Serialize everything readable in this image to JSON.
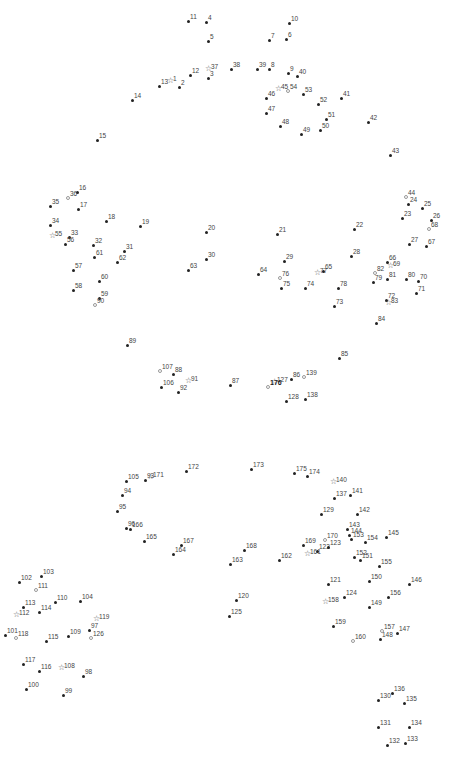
{
  "puzzle": {
    "type": "connect-the-dots",
    "dot_color": "#222222",
    "label_color": "#444444",
    "points": [
      {
        "n": "1",
        "x": 171,
        "y": 83,
        "m": "star"
      },
      {
        "n": "2",
        "x": 179,
        "y": 87,
        "m": "dot"
      },
      {
        "n": "3",
        "x": 208,
        "y": 78,
        "m": "dot"
      },
      {
        "n": "4",
        "x": 206,
        "y": 22,
        "m": "dot"
      },
      {
        "n": "5",
        "x": 208,
        "y": 41,
        "m": "dot"
      },
      {
        "n": "6",
        "x": 286,
        "y": 39,
        "m": "dot"
      },
      {
        "n": "7",
        "x": 269,
        "y": 40,
        "m": "dot"
      },
      {
        "n": "8",
        "x": 269,
        "y": 69,
        "m": "dot"
      },
      {
        "n": "9",
        "x": 288,
        "y": 73,
        "m": "dot"
      },
      {
        "n": "10",
        "x": 289,
        "y": 23,
        "m": "dot"
      },
      {
        "n": "11",
        "x": 188,
        "y": 21,
        "m": "dot"
      },
      {
        "n": "12",
        "x": 190,
        "y": 75,
        "m": "dot"
      },
      {
        "n": "13",
        "x": 159,
        "y": 86,
        "m": "dot"
      },
      {
        "n": "14",
        "x": 132,
        "y": 100,
        "m": "dot"
      },
      {
        "n": "15",
        "x": 97,
        "y": 140,
        "m": "dot"
      },
      {
        "n": "16",
        "x": 77,
        "y": 192,
        "m": "dot"
      },
      {
        "n": "17",
        "x": 78,
        "y": 209,
        "m": "dot"
      },
      {
        "n": "18",
        "x": 106,
        "y": 221,
        "m": "dot"
      },
      {
        "n": "19",
        "x": 140,
        "y": 226,
        "m": "dot"
      },
      {
        "n": "20",
        "x": 206,
        "y": 232,
        "m": "dot"
      },
      {
        "n": "21",
        "x": 277,
        "y": 234,
        "m": "dot"
      },
      {
        "n": "22",
        "x": 354,
        "y": 229,
        "m": "dot"
      },
      {
        "n": "23",
        "x": 402,
        "y": 218,
        "m": "dot"
      },
      {
        "n": "24",
        "x": 408,
        "y": 204,
        "m": "dot"
      },
      {
        "n": "25",
        "x": 422,
        "y": 208,
        "m": "dot"
      },
      {
        "n": "26",
        "x": 431,
        "y": 220,
        "m": "dot"
      },
      {
        "n": "27",
        "x": 409,
        "y": 244,
        "m": "dot"
      },
      {
        "n": "28",
        "x": 351,
        "y": 256,
        "m": "dot"
      },
      {
        "n": "29",
        "x": 284,
        "y": 261,
        "m": "dot"
      },
      {
        "n": "30",
        "x": 206,
        "y": 259,
        "m": "dot"
      },
      {
        "n": "31",
        "x": 124,
        "y": 251,
        "m": "dot"
      },
      {
        "n": "32",
        "x": 93,
        "y": 245,
        "m": "dot"
      },
      {
        "n": "33",
        "x": 69,
        "y": 237,
        "m": "dot"
      },
      {
        "n": "34",
        "x": 50,
        "y": 225,
        "m": "dot"
      },
      {
        "n": "35",
        "x": 50,
        "y": 206,
        "m": "dot"
      },
      {
        "n": "36",
        "x": 68,
        "y": 198,
        "m": "hollow"
      },
      {
        "n": "37",
        "x": 209,
        "y": 71,
        "m": "star"
      },
      {
        "n": "38",
        "x": 231,
        "y": 69,
        "m": "dot"
      },
      {
        "n": "39",
        "x": 257,
        "y": 69,
        "m": "dot"
      },
      {
        "n": "40",
        "x": 297,
        "y": 76,
        "m": "dot"
      },
      {
        "n": "41",
        "x": 341,
        "y": 98,
        "m": "dot"
      },
      {
        "n": "42",
        "x": 368,
        "y": 122,
        "m": "dot"
      },
      {
        "n": "43",
        "x": 390,
        "y": 155,
        "m": "dot"
      },
      {
        "n": "44",
        "x": 406,
        "y": 197,
        "m": "hollow"
      },
      {
        "n": "45",
        "x": 279,
        "y": 91,
        "m": "star"
      },
      {
        "n": "46",
        "x": 266,
        "y": 98,
        "m": "dot"
      },
      {
        "n": "47",
        "x": 266,
        "y": 113,
        "m": "dot"
      },
      {
        "n": "48",
        "x": 280,
        "y": 126,
        "m": "dot"
      },
      {
        "n": "49",
        "x": 301,
        "y": 134,
        "m": "dot"
      },
      {
        "n": "50",
        "x": 320,
        "y": 130,
        "m": "dot"
      },
      {
        "n": "51",
        "x": 326,
        "y": 119,
        "m": "dot"
      },
      {
        "n": "52",
        "x": 318,
        "y": 104,
        "m": "dot"
      },
      {
        "n": "53",
        "x": 303,
        "y": 94,
        "m": "dot"
      },
      {
        "n": "54",
        "x": 288,
        "y": 91,
        "m": "hollow"
      },
      {
        "n": "55",
        "x": 53,
        "y": 238,
        "m": "star"
      },
      {
        "n": "56",
        "x": 65,
        "y": 244,
        "m": "dot"
      },
      {
        "n": "57",
        "x": 73,
        "y": 270,
        "m": "dot"
      },
      {
        "n": "58",
        "x": 73,
        "y": 290,
        "m": "dot"
      },
      {
        "n": "59",
        "x": 99,
        "y": 298,
        "m": "dot"
      },
      {
        "n": "60",
        "x": 99,
        "y": 281,
        "m": "dot"
      },
      {
        "n": "61",
        "x": 94,
        "y": 257,
        "m": "dot"
      },
      {
        "n": "62",
        "x": 117,
        "y": 262,
        "m": "dot"
      },
      {
        "n": "63",
        "x": 188,
        "y": 270,
        "m": "dot"
      },
      {
        "n": "64",
        "x": 258,
        "y": 274,
        "m": "dot"
      },
      {
        "n": "65",
        "x": 323,
        "y": 271,
        "m": "dot"
      },
      {
        "n": "66",
        "x": 387,
        "y": 262,
        "m": "dot"
      },
      {
        "n": "67",
        "x": 426,
        "y": 246,
        "m": "dot"
      },
      {
        "n": "68",
        "x": 429,
        "y": 229,
        "m": "hollow"
      },
      {
        "n": "69",
        "x": 391,
        "y": 268,
        "m": "star"
      },
      {
        "n": "70",
        "x": 418,
        "y": 281,
        "m": "dot"
      },
      {
        "n": "71",
        "x": 416,
        "y": 293,
        "m": "dot"
      },
      {
        "n": "72",
        "x": 386,
        "y": 300,
        "m": "dot"
      },
      {
        "n": "73",
        "x": 334,
        "y": 306,
        "m": "dot"
      },
      {
        "n": "74",
        "x": 305,
        "y": 288,
        "m": "dot"
      },
      {
        "n": "75",
        "x": 281,
        "y": 288,
        "m": "dot"
      },
      {
        "n": "76",
        "x": 280,
        "y": 278,
        "m": "hollow"
      },
      {
        "n": "77",
        "x": 318,
        "y": 275,
        "m": "star"
      },
      {
        "n": "78",
        "x": 338,
        "y": 288,
        "m": "dot"
      },
      {
        "n": "79",
        "x": 373,
        "y": 282,
        "m": "dot"
      },
      {
        "n": "80",
        "x": 406,
        "y": 279,
        "m": "dot"
      },
      {
        "n": "81",
        "x": 387,
        "y": 279,
        "m": "dot"
      },
      {
        "n": "82",
        "x": 375,
        "y": 273,
        "m": "hollow"
      },
      {
        "n": "83",
        "x": 389,
        "y": 305,
        "m": "star"
      },
      {
        "n": "84",
        "x": 376,
        "y": 323,
        "m": "dot"
      },
      {
        "n": "85",
        "x": 339,
        "y": 358,
        "m": "dot"
      },
      {
        "n": "86",
        "x": 291,
        "y": 379,
        "m": "dot"
      },
      {
        "n": "87",
        "x": 230,
        "y": 385,
        "m": "dot"
      },
      {
        "n": "88",
        "x": 173,
        "y": 374,
        "m": "dot"
      },
      {
        "n": "89",
        "x": 127,
        "y": 345,
        "m": "dot"
      },
      {
        "n": "90",
        "x": 95,
        "y": 305,
        "m": "hollow"
      },
      {
        "n": "91",
        "x": 189,
        "y": 383,
        "m": "star"
      },
      {
        "n": "92",
        "x": 178,
        "y": 392,
        "m": "dot"
      },
      {
        "n": "93",
        "x": 145,
        "y": 480,
        "m": "dot"
      },
      {
        "n": "94",
        "x": 122,
        "y": 495,
        "m": "dot"
      },
      {
        "n": "95",
        "x": 117,
        "y": 511,
        "m": "dot"
      },
      {
        "n": "96",
        "x": 126,
        "y": 528,
        "m": "dot"
      },
      {
        "n": "97",
        "x": 89,
        "y": 630,
        "m": "dot"
      },
      {
        "n": "98",
        "x": 83,
        "y": 676,
        "m": "dot"
      },
      {
        "n": "99",
        "x": 63,
        "y": 695,
        "m": "dot"
      },
      {
        "n": "100",
        "x": 26,
        "y": 689,
        "m": "dot"
      },
      {
        "n": "101",
        "x": 5,
        "y": 635,
        "m": "dot"
      },
      {
        "n": "102",
        "x": 19,
        "y": 582,
        "m": "dot"
      },
      {
        "n": "103",
        "x": 41,
        "y": 576,
        "m": "dot"
      },
      {
        "n": "104",
        "x": 80,
        "y": 601,
        "m": "dot"
      },
      {
        "n": "105",
        "x": 126,
        "y": 481,
        "m": "dot"
      },
      {
        "n": "106",
        "x": 161,
        "y": 387,
        "m": "dot"
      },
      {
        "n": "107",
        "x": 160,
        "y": 371,
        "m": "hollow"
      },
      {
        "n": "108",
        "x": 62,
        "y": 670,
        "m": "star"
      },
      {
        "n": "109",
        "x": 68,
        "y": 636,
        "m": "dot"
      },
      {
        "n": "110",
        "x": 55,
        "y": 602,
        "m": "dot"
      },
      {
        "n": "111",
        "x": 36,
        "y": 590,
        "m": "hollow"
      },
      {
        "n": "112",
        "x": 17,
        "y": 617,
        "m": "star"
      },
      {
        "n": "113",
        "x": 23,
        "y": 607,
        "m": "dot"
      },
      {
        "n": "114",
        "x": 39,
        "y": 612,
        "m": "dot"
      },
      {
        "n": "115",
        "x": 46,
        "y": 641,
        "m": "dot"
      },
      {
        "n": "116",
        "x": 39,
        "y": 671,
        "m": "dot"
      },
      {
        "n": "117",
        "x": 23,
        "y": 664,
        "m": "dot"
      },
      {
        "n": "118",
        "x": 16,
        "y": 638,
        "m": "hollow"
      },
      {
        "n": "119",
        "x": 97,
        "y": 621,
        "m": "star"
      },
      {
        "n": "120",
        "x": 236,
        "y": 600,
        "m": "dot"
      },
      {
        "n": "121",
        "x": 328,
        "y": 584,
        "m": "dot"
      },
      {
        "n": "122",
        "x": 317,
        "y": 551,
        "m": "dot"
      },
      {
        "n": "123",
        "x": 328,
        "y": 547,
        "m": "dot"
      },
      {
        "n": "124",
        "x": 344,
        "y": 597,
        "m": "dot"
      },
      {
        "n": "125",
        "x": 229,
        "y": 616,
        "m": "dot"
      },
      {
        "n": "126",
        "x": 91,
        "y": 638,
        "m": "hollow"
      },
      {
        "n": "127",
        "x": 275,
        "y": 384,
        "m": "star"
      },
      {
        "n": "128",
        "x": 286,
        "y": 401,
        "m": "dot"
      },
      {
        "n": "129",
        "x": 321,
        "y": 514,
        "m": "dot"
      },
      {
        "n": "130",
        "x": 378,
        "y": 700,
        "m": "dot"
      },
      {
        "n": "131",
        "x": 378,
        "y": 727,
        "m": "dot"
      },
      {
        "n": "132",
        "x": 387,
        "y": 745,
        "m": "dot"
      },
      {
        "n": "133",
        "x": 405,
        "y": 743,
        "m": "dot"
      },
      {
        "n": "134",
        "x": 409,
        "y": 727,
        "m": "dot"
      },
      {
        "n": "135",
        "x": 404,
        "y": 703,
        "m": "dot"
      },
      {
        "n": "136",
        "x": 392,
        "y": 693,
        "m": "dot"
      },
      {
        "n": "137",
        "x": 334,
        "y": 498,
        "m": "dot"
      },
      {
        "n": "138",
        "x": 305,
        "y": 399,
        "m": "dot"
      },
      {
        "n": "139",
        "x": 304,
        "y": 377,
        "m": "hollow"
      },
      {
        "n": "140",
        "x": 334,
        "y": 484,
        "m": "star"
      },
      {
        "n": "141",
        "x": 350,
        "y": 495,
        "m": "dot"
      },
      {
        "n": "142",
        "x": 357,
        "y": 514,
        "m": "dot"
      },
      {
        "n": "143",
        "x": 347,
        "y": 529,
        "m": "dot"
      },
      {
        "n": "144",
        "x": 349,
        "y": 535,
        "m": "dot"
      },
      {
        "n": "145",
        "x": 386,
        "y": 537,
        "m": "dot"
      },
      {
        "n": "146",
        "x": 409,
        "y": 584,
        "m": "dot"
      },
      {
        "n": "147",
        "x": 397,
        "y": 633,
        "m": "dot"
      },
      {
        "n": "148",
        "x": 380,
        "y": 639,
        "m": "dot"
      },
      {
        "n": "149",
        "x": 369,
        "y": 607,
        "m": "dot"
      },
      {
        "n": "150",
        "x": 369,
        "y": 581,
        "m": "dot"
      },
      {
        "n": "151",
        "x": 360,
        "y": 560,
        "m": "dot"
      },
      {
        "n": "152",
        "x": 354,
        "y": 557,
        "m": "dot"
      },
      {
        "n": "153",
        "x": 351,
        "y": 539,
        "m": "dot"
      },
      {
        "n": "154",
        "x": 365,
        "y": 542,
        "m": "dot"
      },
      {
        "n": "155",
        "x": 379,
        "y": 566,
        "m": "dot"
      },
      {
        "n": "156",
        "x": 388,
        "y": 597,
        "m": "dot"
      },
      {
        "n": "157",
        "x": 382,
        "y": 631,
        "m": "hollow"
      },
      {
        "n": "158",
        "x": 326,
        "y": 604,
        "m": "star"
      },
      {
        "n": "159",
        "x": 333,
        "y": 626,
        "m": "dot"
      },
      {
        "n": "160",
        "x": 353,
        "y": 641,
        "m": "hollow"
      },
      {
        "n": "161",
        "x": 308,
        "y": 556,
        "m": "star"
      },
      {
        "n": "162",
        "x": 279,
        "y": 560,
        "m": "dot"
      },
      {
        "n": "163",
        "x": 230,
        "y": 564,
        "m": "dot"
      },
      {
        "n": "164",
        "x": 173,
        "y": 554,
        "m": "dot"
      },
      {
        "n": "165",
        "x": 144,
        "y": 541,
        "m": "dot"
      },
      {
        "n": "166",
        "x": 130,
        "y": 529,
        "m": "dot"
      },
      {
        "n": "167",
        "x": 181,
        "y": 545,
        "m": "dot"
      },
      {
        "n": "168",
        "x": 244,
        "y": 550,
        "m": "dot"
      },
      {
        "n": "169",
        "x": 303,
        "y": 545,
        "m": "dot"
      },
      {
        "n": "170",
        "x": 325,
        "y": 540,
        "m": "hollow"
      },
      {
        "n": "171",
        "x": 151,
        "y": 479,
        "m": "star"
      },
      {
        "n": "172",
        "x": 186,
        "y": 471,
        "m": "dot"
      },
      {
        "n": "173",
        "x": 251,
        "y": 469,
        "m": "dot"
      },
      {
        "n": "174",
        "x": 307,
        "y": 476,
        "m": "dot"
      },
      {
        "n": "175",
        "x": 294,
        "y": 473,
        "m": "dot"
      },
      {
        "n": "176",
        "x": 268,
        "y": 387,
        "m": "hollow",
        "bold": true
      }
    ]
  }
}
